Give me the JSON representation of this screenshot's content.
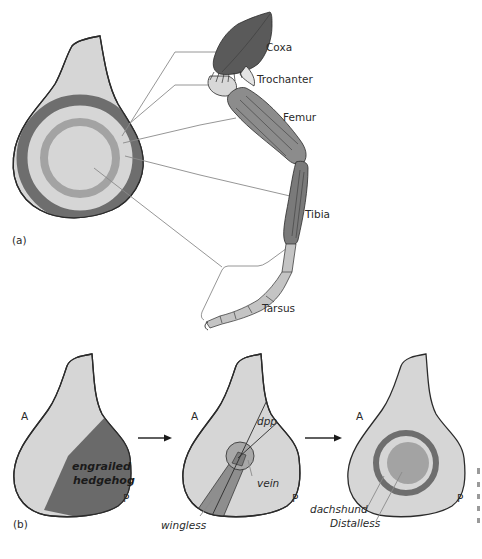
{
  "figure": {
    "panel_a": {
      "label": "(a)",
      "segments": [
        {
          "name": "Coxa",
          "ring": "outer-dark-ring"
        },
        {
          "name": "Trochanter",
          "ring": "light-gap-outer"
        },
        {
          "name": "Femur",
          "ring": "mid-gray-ring"
        },
        {
          "name": "Tibia",
          "ring": "light-gap-inner"
        },
        {
          "name": "Tarsus",
          "ring": "center-disc"
        }
      ]
    },
    "panel_b": {
      "label": "(b)",
      "stage1": {
        "anterior": "A",
        "posterior": "P",
        "region_label_line1": "engrailed",
        "region_label_line2": "hedgehog"
      },
      "stage2": {
        "anterior": "A",
        "posterior": "P",
        "labels": {
          "dpp": "dpp",
          "vein": "vein",
          "wingless": "wingless"
        }
      },
      "stage3": {
        "anterior": "A",
        "posterior": "P",
        "labels": {
          "dachshund": "dachshund",
          "distalless": "Distalless"
        }
      }
    },
    "colors": {
      "disc_fill": "#d6d6d6",
      "dark_ring": "#6e6e6e",
      "mid_ring": "#a3a3a3",
      "engrailed_region": "#6a6a6a",
      "wingless_stripe": "#8e8e8e",
      "leg_dark": "#5a5a5a",
      "leg_mid": "#8c8c8c",
      "leg_light": "#c4c4c4"
    }
  }
}
